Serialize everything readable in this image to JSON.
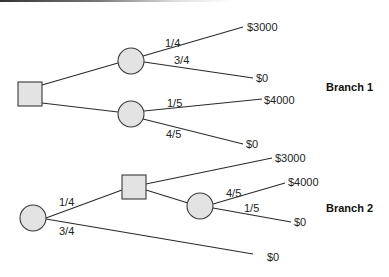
{
  "diagram": {
    "type": "decision-tree",
    "colors": {
      "node_fill": "#e3e3e3",
      "node_stroke": "#3a3a3a",
      "line": "#2a2a2a"
    },
    "branch1": {
      "label": "Branch 1",
      "decision_node": {
        "shape": "square",
        "x": 18,
        "y": 82,
        "w": 24,
        "h": 24
      },
      "chance_top": {
        "shape": "circle",
        "cx": 131,
        "cy": 61,
        "r": 13,
        "outcomes": [
          {
            "prob": "1/4",
            "payoff": "$3000"
          },
          {
            "prob": "3/4",
            "payoff": "$0"
          }
        ]
      },
      "chance_bottom": {
        "shape": "circle",
        "cx": 131,
        "cy": 114,
        "r": 13,
        "outcomes": [
          {
            "prob": "1/5",
            "payoff": "$4000"
          },
          {
            "prob": "4/5",
            "payoff": "$0"
          }
        ]
      }
    },
    "branch2": {
      "label": "Branch 2",
      "chance_root": {
        "shape": "circle",
        "cx": 33,
        "cy": 218,
        "r": 13,
        "outcomes": [
          {
            "prob": "1/4",
            "to": "decision"
          },
          {
            "prob": "3/4",
            "payoff": "$0"
          }
        ]
      },
      "decision_node": {
        "shape": "square",
        "x": 122,
        "y": 175,
        "w": 24,
        "h": 24,
        "options": [
          {
            "payoff": "$3000"
          },
          {
            "to": "chance"
          }
        ]
      },
      "chance_inner": {
        "shape": "circle",
        "cx": 200,
        "cy": 206,
        "r": 13,
        "outcomes": [
          {
            "prob": "4/5",
            "payoff": "$4000"
          },
          {
            "prob": "1/5",
            "payoff": "$0"
          }
        ]
      }
    }
  }
}
